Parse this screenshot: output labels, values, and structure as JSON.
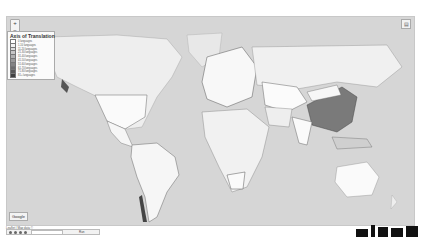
{
  "map": {
    "zoom_in": "+",
    "zoom_out": "−",
    "layer_button_icon": "layers-icon",
    "background_color": "#d6d6d6",
    "land_default_color": "#f4f4f4",
    "highlight_color": "#7a7a7a",
    "highlighted_country": "China"
  },
  "legend": {
    "title": "Axis of Translation",
    "items": [
      {
        "label": "0 languages",
        "color": "#ffffff"
      },
      {
        "label": "1-10 languages",
        "color": "#f0f0f0"
      },
      {
        "label": "11-20 languages",
        "color": "#dcdcdc"
      },
      {
        "label": "21-30 languages",
        "color": "#c6c6c6"
      },
      {
        "label": "31-40 languages",
        "color": "#b0b0b0"
      },
      {
        "label": "41-50 languages",
        "color": "#9a9a9a"
      },
      {
        "label": "51-60 languages",
        "color": "#848484"
      },
      {
        "label": "61-70 languages",
        "color": "#6e6e6e"
      },
      {
        "label": "71-80 languages",
        "color": "#585858"
      },
      {
        "label": "81+ languages",
        "color": "#404040"
      }
    ]
  },
  "footer": {
    "logo": "Google",
    "caption": "Leaflet | Map data ©",
    "toolbar_label": "Run"
  }
}
